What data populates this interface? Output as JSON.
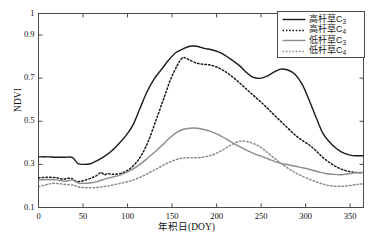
{
  "chart_data": {
    "type": "line",
    "title": "",
    "subtitle": "",
    "xlabel": "年积日(DOY)",
    "ylabel": "NDVI",
    "xlim": [
      0,
      365
    ],
    "ylim": [
      0.1,
      1.0
    ],
    "xticks": [
      0,
      50,
      100,
      150,
      200,
      250,
      300,
      350
    ],
    "xticklabels": [
      "0",
      "50",
      "100",
      "150",
      "200",
      "250",
      "300",
      "350"
    ],
    "yticks": [
      0.1,
      0.3,
      0.5,
      0.7,
      0.9,
      1.0
    ],
    "yticklabels": [
      "0.1",
      "0.3",
      "0.5",
      "0.7",
      "0.9",
      "1"
    ],
    "grid": false,
    "legend_position": "top-right",
    "series": [
      {
        "name": "高杆草C3",
        "label_base": "高杆草C",
        "label_sub": "3",
        "color": "#1a1a1a",
        "style": "solid",
        "width": 1.4,
        "x": [
          0,
          10,
          20,
          30,
          38,
          44,
          50,
          58,
          66,
          74,
          82,
          90,
          98,
          106,
          114,
          122,
          130,
          138,
          146,
          154,
          162,
          170,
          178,
          186,
          194,
          202,
          210,
          218,
          226,
          234,
          240,
          248,
          256,
          264,
          272,
          280,
          288,
          296,
          304,
          312,
          320,
          330,
          340,
          350,
          358,
          365
        ],
        "y": [
          0.335,
          0.335,
          0.333,
          0.333,
          0.332,
          0.305,
          0.3,
          0.303,
          0.318,
          0.337,
          0.362,
          0.395,
          0.432,
          0.482,
          0.56,
          0.638,
          0.697,
          0.74,
          0.783,
          0.818,
          0.835,
          0.848,
          0.848,
          0.838,
          0.832,
          0.822,
          0.805,
          0.782,
          0.757,
          0.725,
          0.706,
          0.699,
          0.708,
          0.727,
          0.742,
          0.738,
          0.718,
          0.672,
          0.598,
          0.515,
          0.44,
          0.39,
          0.358,
          0.343,
          0.34,
          0.34
        ]
      },
      {
        "name": "高杆草C4",
        "label_base": "高杆草C",
        "label_sub": "4",
        "color": "#1a1a1a",
        "style": "dotted",
        "width": 1.5,
        "x": [
          0,
          10,
          20,
          28,
          36,
          42,
          48,
          56,
          64,
          70,
          74,
          78,
          84,
          92,
          100,
          108,
          116,
          124,
          132,
          140,
          148,
          156,
          162,
          168,
          176,
          184,
          192,
          200,
          208,
          216,
          224,
          232,
          240,
          248,
          256,
          264,
          272,
          280,
          288,
          296,
          304,
          312,
          320,
          330,
          340,
          350,
          358,
          365
        ],
        "y": [
          0.238,
          0.24,
          0.238,
          0.232,
          0.236,
          0.222,
          0.222,
          0.232,
          0.245,
          0.262,
          0.252,
          0.257,
          0.254,
          0.258,
          0.272,
          0.3,
          0.345,
          0.415,
          0.505,
          0.598,
          0.69,
          0.76,
          0.795,
          0.788,
          0.772,
          0.765,
          0.762,
          0.752,
          0.735,
          0.712,
          0.685,
          0.655,
          0.625,
          0.596,
          0.565,
          0.532,
          0.5,
          0.468,
          0.437,
          0.412,
          0.39,
          0.362,
          0.33,
          0.3,
          0.278,
          0.266,
          0.262,
          0.262
        ]
      },
      {
        "name": "低杆草C3",
        "label_base": "低杆草C",
        "label_sub": "3",
        "color": "#8c8c8c",
        "style": "solid",
        "width": 1.4,
        "x": [
          0,
          10,
          20,
          30,
          38,
          44,
          50,
          58,
          66,
          74,
          82,
          90,
          98,
          106,
          114,
          122,
          130,
          138,
          146,
          154,
          162,
          170,
          178,
          186,
          194,
          202,
          210,
          218,
          226,
          234,
          242,
          250,
          258,
          266,
          274,
          282,
          290,
          298,
          306,
          314,
          322,
          330,
          340,
          350,
          358,
          365
        ],
        "y": [
          0.228,
          0.23,
          0.228,
          0.222,
          0.228,
          0.215,
          0.212,
          0.214,
          0.22,
          0.232,
          0.24,
          0.248,
          0.262,
          0.278,
          0.3,
          0.327,
          0.355,
          0.385,
          0.418,
          0.445,
          0.462,
          0.468,
          0.468,
          0.462,
          0.452,
          0.438,
          0.42,
          0.4,
          0.382,
          0.365,
          0.35,
          0.338,
          0.325,
          0.312,
          0.303,
          0.297,
          0.29,
          0.283,
          0.275,
          0.266,
          0.258,
          0.254,
          0.252,
          0.258,
          0.262,
          0.262
        ]
      },
      {
        "name": "低杆草C4",
        "label_base": "低杆草C",
        "label_sub": "4",
        "color": "#8c8c8c",
        "style": "dotted",
        "width": 1.5,
        "x": [
          0,
          8,
          16,
          24,
          32,
          40,
          46,
          54,
          62,
          70,
          78,
          86,
          94,
          102,
          110,
          118,
          126,
          134,
          142,
          150,
          158,
          166,
          174,
          182,
          190,
          198,
          206,
          214,
          222,
          228,
          234,
          242,
          250,
          258,
          266,
          274,
          282,
          290,
          298,
          306,
          314,
          322,
          330,
          340,
          350,
          358,
          365
        ],
        "y": [
          0.196,
          0.205,
          0.212,
          0.21,
          0.206,
          0.203,
          0.194,
          0.192,
          0.192,
          0.195,
          0.2,
          0.207,
          0.214,
          0.222,
          0.233,
          0.248,
          0.265,
          0.282,
          0.3,
          0.315,
          0.326,
          0.33,
          0.331,
          0.332,
          0.338,
          0.348,
          0.365,
          0.385,
          0.402,
          0.408,
          0.406,
          0.396,
          0.378,
          0.352,
          0.325,
          0.3,
          0.277,
          0.258,
          0.242,
          0.228,
          0.216,
          0.206,
          0.2,
          0.198,
          0.202,
          0.207,
          0.21
        ]
      }
    ]
  },
  "axes": {
    "frame_color": "#4a4a4a",
    "background": "#ffffff"
  }
}
